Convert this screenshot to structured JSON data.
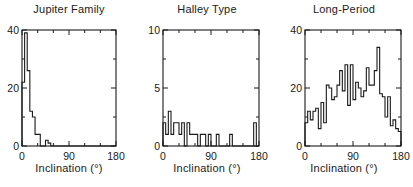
{
  "chart_data": [
    {
      "type": "bar",
      "title": "Jupiter Family",
      "xlabel": "Inclination (°)",
      "ylabel": "",
      "xlim": [
        0,
        180
      ],
      "ylim": [
        0,
        40
      ],
      "xticks": [
        "0",
        "90",
        "180"
      ],
      "yticks": [
        "0",
        "20",
        "40"
      ],
      "bin_width": 5,
      "bin_start": 0,
      "values": [
        22,
        39,
        26,
        12,
        10,
        4,
        4,
        0,
        0,
        2,
        1,
        0,
        0,
        0,
        0,
        0,
        0,
        0,
        0,
        0,
        0,
        0,
        0,
        0,
        0,
        0,
        0,
        0,
        0,
        0,
        0,
        0,
        0,
        0,
        0,
        0
      ],
      "step_style": true
    },
    {
      "type": "bar",
      "title": "Halley Type",
      "xlabel": "Inclination (°)",
      "ylabel": "",
      "xlim": [
        0,
        180
      ],
      "ylim": [
        0,
        10
      ],
      "xticks": [
        "0",
        "90",
        "180"
      ],
      "yticks": [
        "0",
        "5",
        "10"
      ],
      "bin_width": 5,
      "bin_start": 0,
      "values": [
        2,
        1,
        3,
        1,
        2,
        2,
        1,
        2,
        0,
        2,
        1,
        1,
        1,
        0,
        1,
        1,
        0,
        1,
        0,
        0,
        1,
        0,
        0,
        0,
        0,
        1,
        0,
        0,
        0,
        0,
        0,
        0,
        0,
        0,
        2,
        0
      ],
      "step_style": true
    },
    {
      "type": "bar",
      "title": "Long-Period",
      "xlabel": "Inclination (°)",
      "ylabel": "",
      "xlim": [
        0,
        180
      ],
      "ylim": [
        0,
        40
      ],
      "xticks": [
        "0",
        "90",
        "180"
      ],
      "yticks": [
        "0",
        "20",
        "40"
      ],
      "bin_width": 5,
      "bin_start": 0,
      "values": [
        8,
        12,
        9,
        12,
        13,
        6,
        15,
        8,
        21,
        20,
        16,
        17,
        21,
        26,
        19,
        28,
        14,
        28,
        16,
        22,
        20,
        17,
        19,
        27,
        21,
        21,
        26,
        34,
        18,
        17,
        10,
        17,
        7,
        9,
        6,
        5
      ],
      "step_style": true
    }
  ],
  "panels": [
    {
      "title": "Jupiter Family",
      "xlabel": "Inclination  (°)"
    },
    {
      "title": "Halley Type",
      "xlabel": "Inclination  (°)"
    },
    {
      "title": "Long-Period",
      "xlabel": "Inclination  (°)"
    }
  ]
}
